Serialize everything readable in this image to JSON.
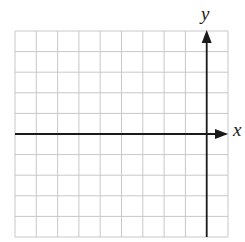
{
  "diagram": {
    "type": "coordinate-grid",
    "grid": {
      "columns": 10,
      "rows": 10,
      "left": 15,
      "top": 31,
      "right": 228,
      "bottom": 237,
      "line_color": "#c8c8c8"
    },
    "axes": {
      "color": "#1a1a1a",
      "x_axis": {
        "label": "x",
        "row_index": 5,
        "arrow": "right"
      },
      "y_axis": {
        "label": "y",
        "column_index": 9,
        "arrow": "up"
      }
    }
  }
}
